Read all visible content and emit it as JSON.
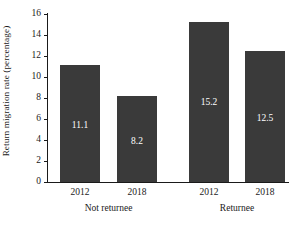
{
  "chart_data": {
    "type": "bar",
    "title": "",
    "xlabel": "",
    "ylabel": "Return migration rate (percentage)",
    "ylim": [
      0,
      16
    ],
    "yticks": [
      0,
      2,
      4,
      6,
      8,
      10,
      12,
      14,
      16
    ],
    "ytick_labels": [
      "0",
      "2",
      "4",
      "6",
      "8",
      "10",
      "12",
      "14",
      "16"
    ],
    "grid": false,
    "legend": "none",
    "groups": [
      {
        "label": "Not returnee",
        "categories": [
          "2012",
          "2018"
        ],
        "values": [
          11.1,
          8.2
        ],
        "value_labels": [
          "11.1",
          "8.2"
        ]
      },
      {
        "label": "Returnee",
        "categories": [
          "2012",
          "2018"
        ],
        "values": [
          15.2,
          12.5
        ],
        "value_labels": [
          "15.2",
          "12.5"
        ]
      }
    ],
    "categories": [
      "2012",
      "2018",
      "2012",
      "2018"
    ],
    "values": [
      11.1,
      8.2,
      15.2,
      12.5
    ],
    "colors": {
      "bar": "#3a3a3a",
      "axis": "#1a1a1a",
      "value_label": "#ffffff",
      "background": "#ffffff"
    }
  }
}
